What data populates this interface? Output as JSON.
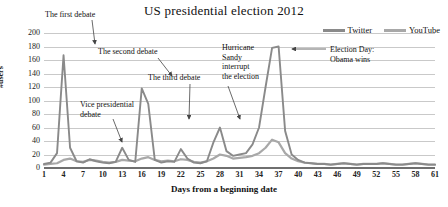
{
  "chart_data": {
    "type": "line",
    "title": "US presidential election 2012",
    "xlabel": "Days from a beginning date",
    "ylabel": "#users",
    "xlim": [
      1,
      61
    ],
    "ylim": [
      0,
      200
    ],
    "grid": true,
    "legend_position": "top-right",
    "xticks": [
      1,
      4,
      7,
      10,
      13,
      16,
      19,
      22,
      25,
      28,
      31,
      34,
      37,
      40,
      43,
      46,
      49,
      52,
      55,
      58,
      61
    ],
    "yticks": [
      0,
      20,
      40,
      60,
      80,
      100,
      120,
      140,
      160,
      180,
      200
    ],
    "x": [
      1,
      2,
      3,
      4,
      5,
      6,
      7,
      8,
      9,
      10,
      11,
      12,
      13,
      14,
      15,
      16,
      17,
      18,
      19,
      20,
      21,
      22,
      23,
      24,
      25,
      26,
      27,
      28,
      29,
      30,
      31,
      32,
      33,
      34,
      35,
      36,
      37,
      38,
      39,
      40,
      41,
      42,
      43,
      44,
      45,
      46,
      47,
      48,
      49,
      50,
      51,
      52,
      53,
      54,
      55,
      56,
      57,
      58,
      59,
      60,
      61
    ],
    "series": [
      {
        "name": "Twitter",
        "color": "#8a8a8a",
        "values": [
          6,
          8,
          22,
          167,
          30,
          10,
          8,
          13,
          10,
          8,
          7,
          9,
          30,
          12,
          9,
          118,
          95,
          12,
          8,
          10,
          9,
          28,
          14,
          8,
          7,
          10,
          38,
          60,
          25,
          18,
          20,
          22,
          35,
          60,
          120,
          178,
          180,
          55,
          20,
          12,
          8,
          7,
          6,
          6,
          5,
          6,
          7,
          6,
          5,
          6,
          6,
          6,
          7,
          6,
          5,
          5,
          6,
          7,
          6,
          5,
          5
        ]
      },
      {
        "name": "YouTube",
        "color": "#a8a8a8",
        "values": [
          5,
          6,
          7,
          12,
          14,
          10,
          9,
          12,
          11,
          9,
          8,
          9,
          12,
          11,
          10,
          14,
          16,
          12,
          10,
          11,
          10,
          13,
          12,
          9,
          8,
          10,
          14,
          20,
          18,
          14,
          15,
          16,
          18,
          22,
          30,
          42,
          38,
          22,
          14,
          10,
          8,
          7,
          6,
          6,
          5,
          6,
          7,
          6,
          5,
          6,
          6,
          6,
          7,
          6,
          5,
          5,
          6,
          7,
          6,
          5,
          5
        ]
      }
    ],
    "annotations": [
      {
        "id": "first-debate",
        "text": "The first debate",
        "x_px": 45,
        "y_px": 10,
        "arrow_from_x": 92,
        "arrow_from_y": 20,
        "arrow_to_x": 95,
        "arrow_to_y": 44
      },
      {
        "id": "vice-presidential-debate",
        "text": "Vice presidential\ndebate",
        "x_px": 80,
        "y_px": 100,
        "arrow_from_x": 113,
        "arrow_from_y": 119,
        "arrow_to_x": 122,
        "arrow_to_y": 142
      },
      {
        "id": "second-debate",
        "text": "The second debate",
        "x_px": 98,
        "y_px": 47,
        "arrow_from_x": 158,
        "arrow_from_y": 58,
        "arrow_to_x": 172,
        "arrow_to_y": 76
      },
      {
        "id": "third-debate",
        "text": "The third debate",
        "x_px": 148,
        "y_px": 73,
        "arrow_from_x": 190,
        "arrow_from_y": 84,
        "arrow_to_x": 189,
        "arrow_to_y": 119
      },
      {
        "id": "hurricane-sandy",
        "text": "Hurricane\nSandy\ninterrupt\nthe election",
        "x_px": 222,
        "y_px": 43,
        "arrow_from_x": 228,
        "arrow_from_y": 86,
        "arrow_to_x": 240,
        "arrow_to_y": 119
      },
      {
        "id": "election-day",
        "text": "Election Day:\nObama wins",
        "x_px": 330,
        "y_px": 45,
        "arrow_from_x": 326,
        "arrow_from_y": 49,
        "arrow_to_x": 292,
        "arrow_to_y": 49
      }
    ]
  },
  "legend": {
    "items": [
      {
        "label": "Twitter",
        "color": "#8a8a8a"
      },
      {
        "label": "YouTube",
        "color": "#a8a8a8"
      }
    ]
  }
}
